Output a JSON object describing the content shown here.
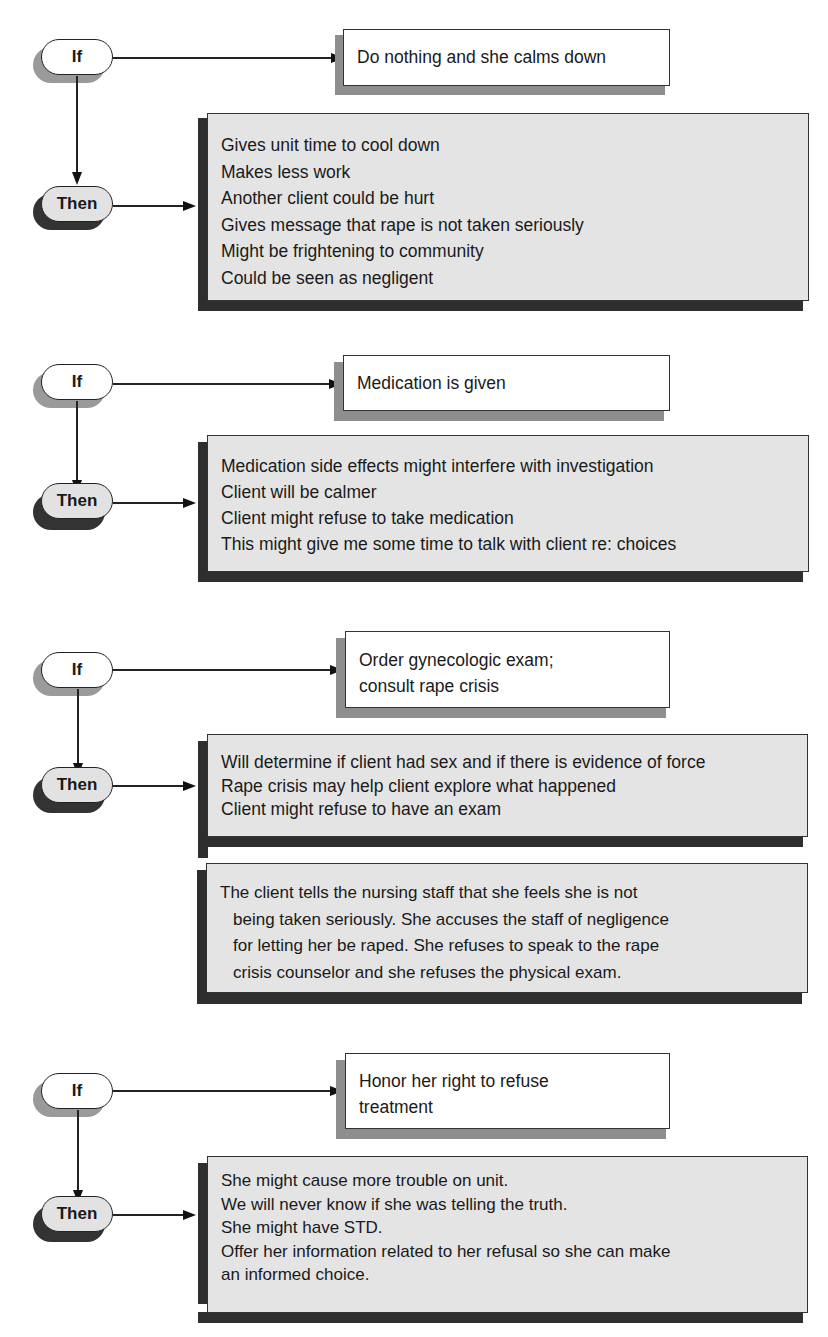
{
  "diagram": {
    "blocks": [
      {
        "if_label": "If",
        "then_label": "Then",
        "if_action": [
          "Do nothing and she calms down"
        ],
        "then_consequences": [
          "Gives unit time to cool down",
          "Makes less work",
          "Another client could be hurt",
          "Gives message that rape is not taken seriously",
          "Might be frightening to community",
          "Could be seen as negligent"
        ]
      },
      {
        "if_label": "If",
        "then_label": "Then",
        "if_action": [
          "Medication is given"
        ],
        "then_consequences": [
          "Medication side effects might interfere with investigation",
          "Client will be calmer",
          "Client might refuse to take medication",
          "This might give me some time to talk with client re: choices"
        ]
      },
      {
        "if_label": "If",
        "then_label": "Then",
        "if_action": [
          "Order gynecologic exam;",
          "consult rape crisis"
        ],
        "then_consequences": [
          "Will determine if client had sex and if there is evidence of force",
          "Rape crisis may help client explore what happened",
          "Client might refuse to have an exam"
        ]
      },
      {
        "if_label": "If",
        "then_label": "Then",
        "if_action": [
          "Honor her right to refuse",
          "treatment"
        ],
        "then_consequences": [
          "She might cause more trouble on unit.",
          "We will never know if she was telling the truth.",
          "She might have STD.",
          "Offer her information related to her refusal so she can make",
          "an informed choice."
        ]
      }
    ],
    "narrative": [
      "The client tells the nursing staff that she feels she is not",
      "being taken seriously. She accuses the staff of negligence",
      "for letting her be raped. She refuses to speak to the rape",
      "crisis counselor and she refuses the physical exam."
    ]
  }
}
